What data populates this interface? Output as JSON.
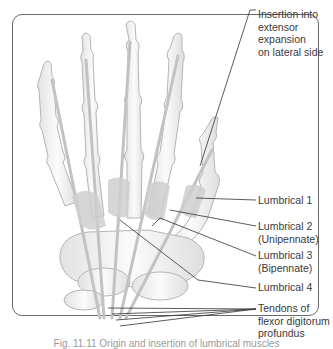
{
  "figure": {
    "labels": [
      {
        "id": "insertion",
        "text": "Insertion into\nextensor\nexpansion\non lateral side",
        "top": 62
      },
      {
        "id": "lumbrical-1",
        "text": "Lumbrical 1",
        "top": 195
      },
      {
        "id": "lumbrical-2",
        "text": "Lumbrical 2\n(Unipennate)",
        "top": 221
      },
      {
        "id": "lumbrical-3",
        "text": "Lumbrical 3\n(Bipennate)",
        "top": 250
      },
      {
        "id": "lumbrical-4",
        "text": "Lumbrical 4",
        "top": 282
      },
      {
        "id": "fdp-tendons",
        "text": "Tendons of\nflexor digitorum\nprofundus",
        "top": 303
      }
    ],
    "caption": "Fig. 11.11  Origin and insertion of lumbrical muscles",
    "colors": {
      "frame": "#6a6a6a",
      "bone_fill": "#f4f4f4",
      "bone_stroke": "#b8b8b8",
      "tendon": "#c4c4c4",
      "muscle": "#cfcfcf",
      "leader": "#333333",
      "text": "#3a3a3a"
    }
  }
}
